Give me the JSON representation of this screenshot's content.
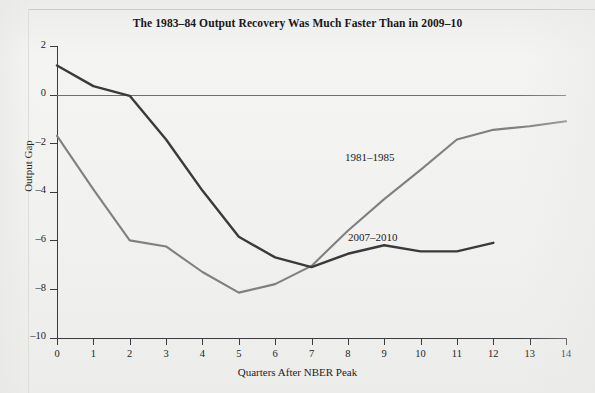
{
  "chart_data": {
    "type": "line",
    "title": "The 1983–84 Output Recovery Was Much Faster Than in 2009–10",
    "xlabel": "Quarters After NBER Peak",
    "ylabel": "Output Gap",
    "xlim": [
      0,
      14
    ],
    "ylim": [
      -10,
      2
    ],
    "xticks": [
      "0",
      "1",
      "2",
      "3",
      "4",
      "5",
      "6",
      "7",
      "8",
      "9",
      "10",
      "11",
      "12",
      "13",
      "14"
    ],
    "yticks": [
      "2",
      "0",
      "–2",
      "–4",
      "–6",
      "–8",
      "–10"
    ],
    "grid": false,
    "legend_position": "inline-annotation",
    "zero_line": 0,
    "series": [
      {
        "name": "1981–1985",
        "color": "#808083",
        "x": [
          0,
          1,
          2,
          3,
          4,
          5,
          6,
          7,
          8,
          9,
          10,
          11,
          12,
          13,
          14
        ],
        "values": [
          -1.7,
          -3.9,
          -6.0,
          -6.25,
          -7.3,
          -8.15,
          -7.8,
          -7.05,
          -5.6,
          -4.3,
          -3.1,
          -1.85,
          -1.45,
          -1.3,
          -1.1
        ]
      },
      {
        "name": "2007–2010",
        "color": "#3a3a3d",
        "x": [
          0,
          1,
          2,
          3,
          4,
          5,
          6,
          7,
          8,
          9,
          10,
          11,
          12
        ],
        "values": [
          1.2,
          0.35,
          -0.05,
          -1.85,
          -3.95,
          -5.85,
          -6.7,
          -7.1,
          -6.55,
          -6.2,
          -6.45,
          -6.45,
          -6.1
        ]
      }
    ],
    "annotations": [
      {
        "text": "1981–1985",
        "x": 8.0,
        "y": -3.2
      },
      {
        "text": "2007–2010",
        "x": 8.1,
        "y": -5.45
      }
    ]
  },
  "style": {
    "page_background": "#f1f1ef",
    "axis_color": "#3b3b3d",
    "zero_line_color": "#6f6f72",
    "title_color": "#18181a"
  }
}
